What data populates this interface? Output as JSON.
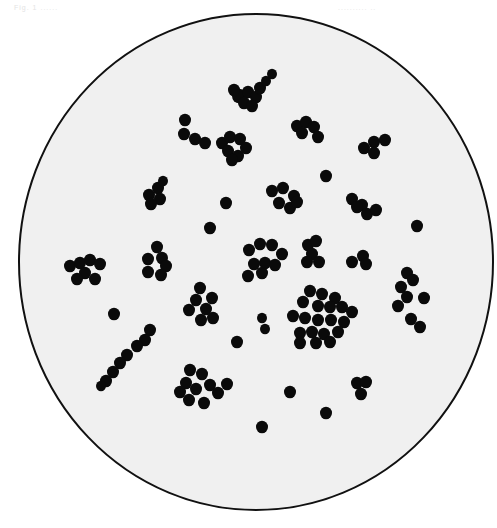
{
  "figure": {
    "header_left": "Fig. 1  ......",
    "header_right": "..........  ..",
    "field": {
      "cx": 256,
      "cy": 262,
      "rx": 237,
      "ry": 248,
      "fill": "#f0f0f0",
      "stroke": "#111111"
    },
    "coccus_color": "#0a0a0a",
    "cocci": [
      [
        239,
        96,
        7
      ],
      [
        248,
        92,
        6
      ],
      [
        256,
        97,
        6
      ],
      [
        244,
        103,
        6
      ],
      [
        252,
        106,
        6
      ],
      [
        260,
        88,
        6
      ],
      [
        266,
        81,
        5
      ],
      [
        272,
        74,
        5
      ],
      [
        234,
        90,
        6
      ],
      [
        185,
        120,
        6
      ],
      [
        184,
        134,
        6
      ],
      [
        195,
        139,
        6
      ],
      [
        205,
        143,
        6
      ],
      [
        222,
        143,
        6
      ],
      [
        230,
        137,
        6
      ],
      [
        240,
        139,
        6
      ],
      [
        228,
        151,
        6
      ],
      [
        238,
        156,
        6
      ],
      [
        246,
        148,
        6
      ],
      [
        232,
        160,
        6
      ],
      [
        297,
        126,
        6
      ],
      [
        306,
        122,
        6
      ],
      [
        314,
        127,
        6
      ],
      [
        302,
        133,
        6
      ],
      [
        318,
        137,
        6
      ],
      [
        364,
        148,
        6
      ],
      [
        374,
        142,
        6
      ],
      [
        385,
        140,
        6
      ],
      [
        374,
        153,
        6
      ],
      [
        149,
        195,
        6
      ],
      [
        158,
        188,
        6
      ],
      [
        160,
        199,
        6
      ],
      [
        151,
        204,
        6
      ],
      [
        163,
        181,
        5
      ],
      [
        226,
        203,
        6
      ],
      [
        210,
        228,
        6
      ],
      [
        326,
        176,
        6
      ],
      [
        417,
        226,
        6
      ],
      [
        272,
        191,
        6
      ],
      [
        283,
        188,
        6
      ],
      [
        294,
        196,
        6
      ],
      [
        279,
        203,
        6
      ],
      [
        290,
        208,
        6
      ],
      [
        297,
        202,
        6
      ],
      [
        352,
        199,
        6
      ],
      [
        362,
        205,
        6
      ],
      [
        367,
        214,
        6
      ],
      [
        376,
        210,
        6
      ],
      [
        357,
        207,
        6
      ],
      [
        70,
        266,
        6
      ],
      [
        80,
        263,
        6
      ],
      [
        90,
        260,
        6
      ],
      [
        100,
        264,
        6
      ],
      [
        85,
        273,
        6
      ],
      [
        77,
        279,
        6
      ],
      [
        95,
        279,
        6
      ],
      [
        148,
        259,
        6
      ],
      [
        157,
        247,
        6
      ],
      [
        162,
        258,
        6
      ],
      [
        166,
        266,
        6
      ],
      [
        148,
        272,
        6
      ],
      [
        161,
        275,
        6
      ],
      [
        249,
        250,
        6
      ],
      [
        260,
        244,
        6
      ],
      [
        272,
        245,
        6
      ],
      [
        282,
        254,
        6
      ],
      [
        254,
        264,
        6
      ],
      [
        265,
        263,
        6
      ],
      [
        275,
        265,
        6
      ],
      [
        248,
        276,
        6
      ],
      [
        262,
        273,
        6
      ],
      [
        308,
        245,
        6
      ],
      [
        316,
        241,
        6
      ],
      [
        312,
        254,
        6
      ],
      [
        319,
        262,
        6
      ],
      [
        307,
        262,
        6
      ],
      [
        352,
        262,
        6
      ],
      [
        363,
        256,
        6
      ],
      [
        366,
        264,
        6
      ],
      [
        407,
        273,
        6
      ],
      [
        413,
        280,
        6
      ],
      [
        401,
        287,
        6
      ],
      [
        407,
        297,
        6
      ],
      [
        398,
        306,
        6
      ],
      [
        424,
        298,
        6
      ],
      [
        411,
        319,
        6
      ],
      [
        420,
        327,
        6
      ],
      [
        200,
        288,
        6
      ],
      [
        196,
        300,
        6
      ],
      [
        212,
        298,
        6
      ],
      [
        206,
        309,
        6
      ],
      [
        189,
        310,
        6
      ],
      [
        201,
        320,
        6
      ],
      [
        213,
        318,
        6
      ],
      [
        310,
        291,
        6
      ],
      [
        322,
        294,
        6
      ],
      [
        335,
        298,
        6
      ],
      [
        303,
        302,
        6
      ],
      [
        318,
        306,
        6
      ],
      [
        330,
        307,
        6
      ],
      [
        342,
        307,
        6
      ],
      [
        352,
        312,
        6
      ],
      [
        293,
        316,
        6
      ],
      [
        305,
        318,
        6
      ],
      [
        318,
        320,
        6
      ],
      [
        331,
        320,
        6
      ],
      [
        344,
        322,
        6
      ],
      [
        300,
        333,
        6
      ],
      [
        312,
        332,
        6
      ],
      [
        324,
        334,
        6
      ],
      [
        338,
        332,
        6
      ],
      [
        300,
        343,
        6
      ],
      [
        316,
        343,
        6
      ],
      [
        330,
        342,
        6
      ],
      [
        262,
        318,
        5
      ],
      [
        265,
        329,
        5
      ],
      [
        237,
        342,
        6
      ],
      [
        114,
        314,
        6
      ],
      [
        150,
        330,
        6
      ],
      [
        145,
        340,
        6
      ],
      [
        137,
        346,
        6
      ],
      [
        127,
        355,
        6
      ],
      [
        120,
        363,
        6
      ],
      [
        113,
        372,
        6
      ],
      [
        106,
        381,
        6
      ],
      [
        101,
        386,
        5
      ],
      [
        190,
        370,
        6
      ],
      [
        202,
        374,
        6
      ],
      [
        186,
        383,
        6
      ],
      [
        196,
        389,
        6
      ],
      [
        210,
        385,
        6
      ],
      [
        218,
        393,
        6
      ],
      [
        189,
        400,
        6
      ],
      [
        204,
        403,
        6
      ],
      [
        227,
        384,
        6
      ],
      [
        180,
        392,
        6
      ],
      [
        290,
        392,
        6
      ],
      [
        326,
        413,
        6
      ],
      [
        262,
        427,
        6
      ],
      [
        357,
        383,
        6
      ],
      [
        366,
        382,
        6
      ],
      [
        361,
        394,
        6
      ]
    ]
  }
}
